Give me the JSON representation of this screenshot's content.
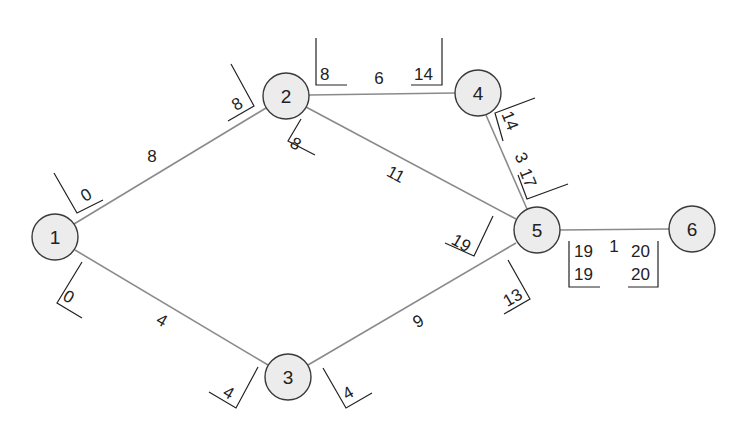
{
  "diagram": {
    "type": "activity-network (critical path)",
    "nodes": [
      {
        "id": "1",
        "label": "1",
        "x": 55,
        "y": 237
      },
      {
        "id": "2",
        "label": "2",
        "x": 286,
        "y": 96
      },
      {
        "id": "3",
        "label": "3",
        "x": 288,
        "y": 377
      },
      {
        "id": "4",
        "label": "4",
        "x": 478,
        "y": 93
      },
      {
        "id": "5",
        "label": "5",
        "x": 537,
        "y": 230
      },
      {
        "id": "6",
        "label": "6",
        "x": 692,
        "y": 229
      }
    ],
    "edges": [
      {
        "from": "1",
        "to": "2",
        "duration": "8"
      },
      {
        "from": "1",
        "to": "3",
        "duration": "4"
      },
      {
        "from": "2",
        "to": "4",
        "duration": "6"
      },
      {
        "from": "2",
        "to": "5",
        "duration": "11"
      },
      {
        "from": "3",
        "to": "5",
        "duration": "9"
      },
      {
        "from": "4",
        "to": "5",
        "duration": "3"
      },
      {
        "from": "5",
        "to": "6",
        "duration": "1"
      }
    ],
    "time_labels": {
      "e12_start": "0",
      "e12_end": "8",
      "e13_start": "0",
      "e13_end": "4",
      "e24_start": "8",
      "e24_end": "14",
      "e25_start": "8",
      "e25_end": "19",
      "e35_start": "4",
      "e35_end": "13",
      "e45_start": "14",
      "e45_end": "17",
      "e56_start_top": "19",
      "e56_start_bottom": "19",
      "e56_end_top": "20",
      "e56_end_bottom": "20"
    }
  }
}
